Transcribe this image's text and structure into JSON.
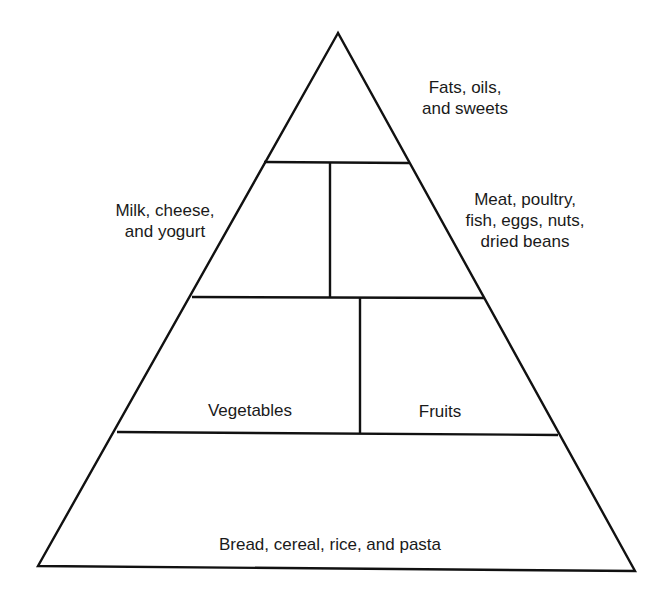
{
  "diagram": {
    "type": "food-pyramid",
    "line_color": "#111111",
    "background": "#ffffff",
    "tiers": [
      {
        "level": 1,
        "sections": [
          {
            "id": "fats",
            "label": "Fats, oils,\nand sweets"
          }
        ]
      },
      {
        "level": 2,
        "sections": [
          {
            "id": "dairy",
            "label": "Milk, cheese,\nand yogurt"
          },
          {
            "id": "protein",
            "label": "Meat, poultry,\nfish, eggs, nuts,\ndried beans"
          }
        ]
      },
      {
        "level": 3,
        "sections": [
          {
            "id": "vegetables",
            "label": "Vegetables"
          },
          {
            "id": "fruits",
            "label": "Fruits"
          }
        ]
      },
      {
        "level": 4,
        "sections": [
          {
            "id": "grains",
            "label": "Bread, cereal, rice, and pasta"
          }
        ]
      }
    ]
  }
}
